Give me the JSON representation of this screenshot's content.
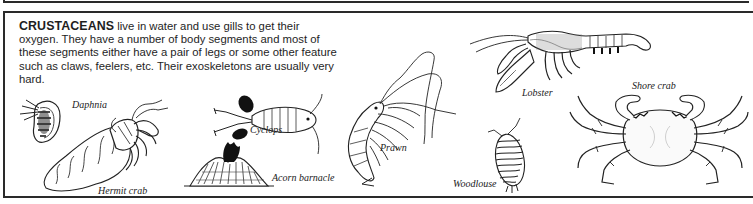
{
  "section": {
    "heading": "CRUSTACEANS",
    "body": " live in water and use gills to get their oxygen. They have a number of body segments and most of these segments either have a pair of legs or some other feature such as claws, feelers, etc. Their exoskeletons are usually very hard."
  },
  "illustrations": [
    {
      "id": "daphnia",
      "label": "Daphnia"
    },
    {
      "id": "hermit-crab",
      "label": "Hermit crab"
    },
    {
      "id": "cyclops",
      "label": "Cyclops"
    },
    {
      "id": "acorn-barnacle",
      "label": "Acorn barnacle"
    },
    {
      "id": "prawn",
      "label": "Prawn"
    },
    {
      "id": "lobster",
      "label": "Lobster"
    },
    {
      "id": "woodlouse",
      "label": "Woodlouse"
    },
    {
      "id": "shore-crab",
      "label": "Shore crab"
    }
  ],
  "colors": {
    "border": "#2a2a2a",
    "text": "#1e1e1e",
    "background": "#ffffff"
  }
}
